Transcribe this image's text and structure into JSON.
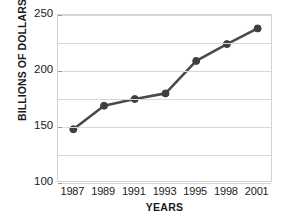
{
  "chart_data": {
    "type": "line",
    "title": "",
    "xlabel": "YEARS",
    "ylabel": "BILLIONS OF DOLLARS",
    "categories": [
      "1987",
      "1989",
      "1991",
      "1993",
      "1995",
      "1998",
      "2001"
    ],
    "values": [
      148,
      169,
      175,
      180,
      209,
      224,
      238
    ],
    "series": [
      {
        "name": "",
        "values": [
          148,
          169,
          175,
          180,
          209,
          224,
          238
        ]
      }
    ],
    "ylim": [
      100,
      250
    ],
    "y_tick_labels": [
      "250",
      "200",
      "150",
      "100"
    ],
    "y_tick_values": [
      250,
      200,
      150,
      100
    ],
    "gridline_values": [
      250,
      225,
      200,
      175,
      150,
      125,
      100
    ],
    "grid": true,
    "legend": "none",
    "marker": "circle",
    "line_color": "#4a4a4a",
    "marker_color": "#3f3f3f",
    "grid_color": "#d8d8d8",
    "frame_color": "#d2d2d2",
    "background_color": "#ffffff",
    "text_color": "#1a1a1a"
  }
}
